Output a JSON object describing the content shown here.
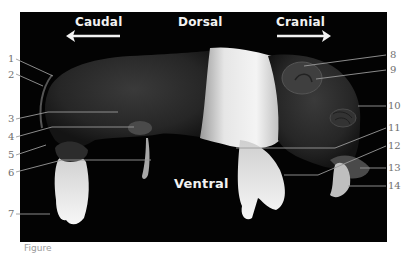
{
  "figure": {
    "background_color": "#030303",
    "label_color": "#6e6e6e",
    "leader_line_color": "#9a9a9a",
    "orientation_labels": {
      "caudal": "Caudal",
      "dorsal": "Dorsal",
      "cranial": "Cranial",
      "ventral": "Ventral"
    },
    "callouts": [
      {
        "number": "1",
        "side": "left"
      },
      {
        "number": "2",
        "side": "left"
      },
      {
        "number": "3",
        "side": "left"
      },
      {
        "number": "4",
        "side": "left"
      },
      {
        "number": "5",
        "side": "left"
      },
      {
        "number": "6",
        "side": "left"
      },
      {
        "number": "7",
        "side": "left"
      },
      {
        "number": "8",
        "side": "right"
      },
      {
        "number": "9",
        "side": "right"
      },
      {
        "number": "10",
        "side": "right"
      },
      {
        "number": "11",
        "side": "right"
      },
      {
        "number": "12",
        "side": "right"
      },
      {
        "number": "13",
        "side": "right"
      },
      {
        "number": "14",
        "side": "right"
      }
    ],
    "caption_partial": "Figure"
  }
}
